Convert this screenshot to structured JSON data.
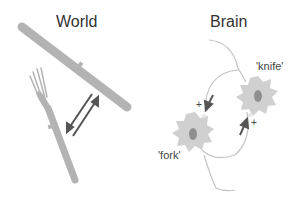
{
  "panels": {
    "world": {
      "title": "World"
    },
    "brain": {
      "title": "Brain"
    }
  },
  "neurons": {
    "knife": {
      "label": "'knife'"
    },
    "fork": {
      "label": "'fork'"
    }
  },
  "synapse_signs": {
    "top": "+",
    "bottom": "+"
  },
  "colors": {
    "object_fill": "#b3b3b3",
    "neuron_fill": "#d0d0d0",
    "nucleus_fill": "#8f8f8f",
    "arrow": "#555555",
    "axon": "#bbbbbb",
    "text": "#333333"
  }
}
